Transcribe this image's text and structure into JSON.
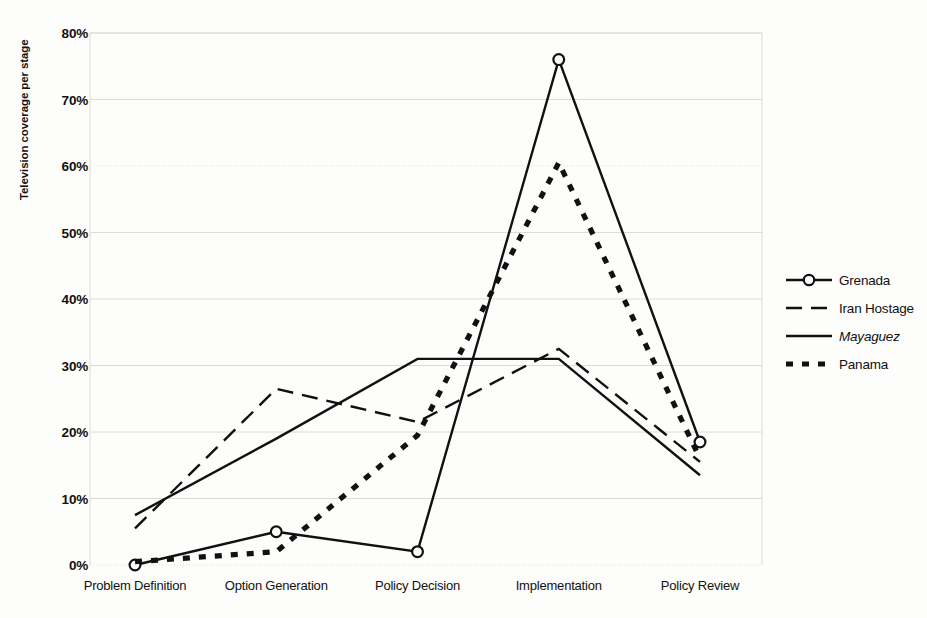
{
  "chart_data": {
    "type": "line",
    "title": "",
    "xlabel": "",
    "ylabel": "Television coverage per stage",
    "categories": [
      "Problem Definition",
      "Option Generation",
      "Policy Decision",
      "Implementation",
      "Policy Review"
    ],
    "ylim": [
      0,
      80
    ],
    "ytick_labels": [
      "0%",
      "10%",
      "20%",
      "30%",
      "40%",
      "50%",
      "60%",
      "70%",
      "80%"
    ],
    "ytick_values": [
      0,
      10,
      20,
      30,
      40,
      50,
      60,
      70,
      80
    ],
    "grid": true,
    "legend_position": "right",
    "series": [
      {
        "name": "Grenada",
        "values": [
          0,
          5,
          2,
          76,
          18.5
        ],
        "style": "solid-with-circle-markers",
        "color": "#111111"
      },
      {
        "name": "Iran Hostage",
        "values": [
          5.5,
          26.5,
          21.5,
          32.5,
          15.5
        ],
        "style": "long-dashed",
        "color": "#111111"
      },
      {
        "name": "Mayaguez",
        "values": [
          7.5,
          19,
          31,
          31,
          13.5
        ],
        "style": "solid",
        "color": "#111111",
        "italic": true
      },
      {
        "name": "Panama",
        "values": [
          0.5,
          2,
          19.5,
          60.5,
          16
        ],
        "style": "thick-dotted",
        "color": "#111111"
      }
    ]
  },
  "axis": {
    "y_title": "Television coverage per stage"
  },
  "legend": {
    "items": [
      {
        "label": "Grenada",
        "icon": "line-circle-marker-icon"
      },
      {
        "label": "Iran Hostage",
        "icon": "line-dashed-icon"
      },
      {
        "label": "Mayaguez",
        "icon": "line-solid-icon"
      },
      {
        "label": "Panama",
        "icon": "line-dotted-icon"
      }
    ]
  },
  "colors": {
    "ink": "#111111",
    "grid": "#dcdcd6",
    "background": "#fdfdfb"
  }
}
